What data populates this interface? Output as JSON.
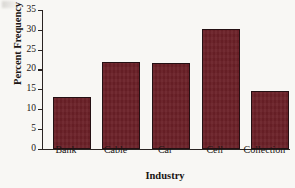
{
  "chart_data": {
    "type": "bar",
    "title": "",
    "xlabel": "Industry",
    "ylabel": "Percent Frequency",
    "categories": [
      "Bank",
      "Cable",
      "Car",
      "Cell",
      "Collection"
    ],
    "values": [
      13,
      22,
      21.5,
      30.3,
      14.5
    ],
    "ylim": [
      0,
      35
    ],
    "yticks": [
      0,
      5,
      10,
      15,
      20,
      25,
      30,
      35
    ],
    "ytick_labels": [
      "0",
      "5",
      "10",
      "15",
      "20",
      "25",
      "30",
      "35"
    ],
    "grid": false,
    "legend": null,
    "bar_color": "#6b2027",
    "bar_edge_color": "#241013",
    "axis_color": "#2a2422",
    "background_color": "#f8f7f4"
  },
  "figure": {
    "y_axis_title": "Percent Frequency",
    "x_axis_title": "Industry"
  }
}
